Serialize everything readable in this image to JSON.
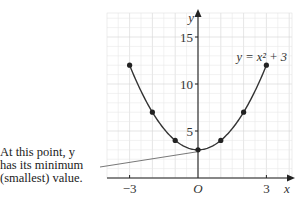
{
  "chart_data": {
    "type": "line",
    "title": "",
    "equation_label": "y = x² + 3",
    "xlabel": "x",
    "ylabel": "y",
    "origin_label": "O",
    "x_ticks": [
      -3,
      3
    ],
    "x_tick_labels": [
      "−3",
      "3"
    ],
    "y_ticks": [
      5,
      10,
      15
    ],
    "y_tick_labels": [
      "5",
      "10",
      "15"
    ],
    "xlim": [
      -4,
      4
    ],
    "ylim": [
      0,
      17.5
    ],
    "grid": true,
    "series": [
      {
        "name": "y = x^2 + 3",
        "x": [
          -3,
          -2,
          -1,
          0,
          1,
          2,
          3
        ],
        "y": [
          12,
          7,
          4,
          3,
          4,
          7,
          12
        ]
      }
    ],
    "annotation": {
      "lines": [
        "At this point, y",
        "has its minimum",
        "(smallest) value."
      ],
      "points_to": [
        0,
        3
      ]
    }
  }
}
